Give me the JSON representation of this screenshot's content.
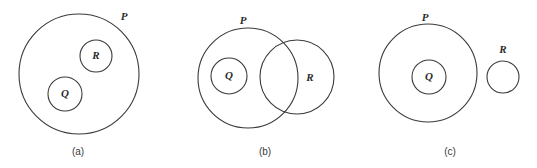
{
  "figure": {
    "background_color": "#ffffff",
    "stroke_color": "#3a3a3a",
    "label_color": "#2b2b2b",
    "width": 537,
    "height": 168
  },
  "panels": [
    {
      "caption": "(a)",
      "caption_x": 78,
      "caption_y": 152,
      "description": "Q and R are disjoint subsets of P",
      "sets": [
        {
          "name": "P",
          "cx": 79,
          "cy": 74,
          "r": 60,
          "label_x": 124,
          "label_y": 17
        },
        {
          "name": "R",
          "cx": 96,
          "cy": 56,
          "r": 16,
          "label_x": 96,
          "label_y": 56
        },
        {
          "name": "Q",
          "cx": 65,
          "cy": 94,
          "r": 17,
          "label_x": 65,
          "label_y": 94
        }
      ]
    },
    {
      "caption": "(b)",
      "caption_x": 265,
      "caption_y": 152,
      "description": "Q is a subset of P; R overlaps P",
      "sets": [
        {
          "name": "P",
          "cx": 248,
          "cy": 78,
          "r": 50,
          "label_x": 243,
          "label_y": 21
        },
        {
          "name": "R",
          "cx": 297,
          "cy": 77,
          "r": 37,
          "label_x": 310,
          "label_y": 78
        },
        {
          "name": "Q",
          "cx": 229,
          "cy": 76,
          "r": 18,
          "label_x": 229,
          "label_y": 76
        }
      ]
    },
    {
      "caption": "(c)",
      "caption_x": 450,
      "caption_y": 152,
      "description": "Q is a subset of P; R is disjoint from P",
      "sets": [
        {
          "name": "P",
          "cx": 428,
          "cy": 73,
          "r": 49,
          "label_x": 425,
          "label_y": 18
        },
        {
          "name": "Q",
          "cx": 429,
          "cy": 77,
          "r": 17,
          "label_x": 429,
          "label_y": 77
        },
        {
          "name": "R",
          "cx": 503,
          "cy": 77,
          "r": 16,
          "label_x": 503,
          "label_y": 50
        }
      ]
    }
  ]
}
